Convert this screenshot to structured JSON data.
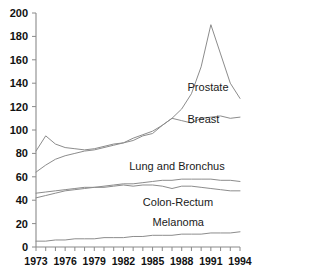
{
  "chart_data": {
    "type": "line",
    "title": "",
    "subtitle": "",
    "xlabel": "",
    "ylabel": "",
    "xlim": [
      1973,
      1994
    ],
    "ylim": [
      0,
      200
    ],
    "grid": false,
    "legend_position": "inline-right",
    "y_ticks": [
      0,
      20,
      40,
      60,
      80,
      100,
      120,
      140,
      160,
      180,
      200
    ],
    "y_tick_labels": [
      "0",
      "20",
      "40",
      "60",
      "80",
      "100",
      "120",
      "140",
      "160",
      "180",
      "200"
    ],
    "x_ticks": [
      1973,
      1974,
      1975,
      1976,
      1977,
      1978,
      1979,
      1980,
      1981,
      1982,
      1983,
      1984,
      1985,
      1986,
      1987,
      1988,
      1989,
      1990,
      1991,
      1992,
      1993,
      1994
    ],
    "x_tick_labels": [
      "1973",
      "1976",
      "1979",
      "1982",
      "1985",
      "1988",
      "1991",
      "1994"
    ],
    "x_labeled_ticks": [
      1973,
      1976,
      1979,
      1982,
      1985,
      1988,
      1991,
      1994
    ],
    "x": [
      1973,
      1974,
      1975,
      1976,
      1977,
      1978,
      1979,
      1980,
      1981,
      1982,
      1983,
      1984,
      1985,
      1986,
      1987,
      1988,
      1989,
      1990,
      1991,
      1992,
      1993,
      1994
    ],
    "series": [
      {
        "name": "Prostate",
        "label": "Prostate",
        "color": "#8c8c8c",
        "label_x": 1988.6,
        "label_y": 133,
        "values": [
          82,
          95,
          88,
          85,
          84,
          83,
          84,
          86,
          88,
          89,
          93,
          96,
          99,
          104,
          110,
          118,
          131,
          154,
          190,
          165,
          140,
          127
        ]
      },
      {
        "name": "Breast",
        "label": "Breast",
        "color": "#8c8c8c",
        "label_x": 1988.6,
        "label_y": 106,
        "values": [
          64,
          70,
          75,
          78,
          80,
          82,
          83,
          85,
          87,
          89,
          91,
          95,
          97,
          104,
          110,
          108,
          106,
          110,
          111,
          112,
          110,
          111
        ]
      },
      {
        "name": "Lung and Bronchus",
        "label": "Lung and Bronchus",
        "color": "#8c8c8c",
        "label_x": 1982.6,
        "label_y": 66,
        "values": [
          46,
          47,
          48,
          49,
          50,
          51,
          51,
          52,
          53,
          54,
          54,
          55,
          56,
          57,
          57,
          58,
          58,
          58,
          58,
          57,
          57,
          56
        ]
      },
      {
        "name": "Colon-Rectum",
        "label": "Colon-Rectum",
        "color": "#8c8c8c",
        "label_x": 1984.0,
        "label_y": 35,
        "values": [
          42,
          44,
          46,
          48,
          49,
          50,
          51,
          51,
          52,
          53,
          52,
          53,
          53,
          52,
          50,
          52,
          52,
          51,
          50,
          49,
          48,
          48
        ]
      },
      {
        "name": "Melanoma",
        "label": "Melanoma",
        "color": "#8c8c8c",
        "label_x": 1985.0,
        "label_y": 18,
        "values": [
          5,
          5,
          6,
          6,
          7,
          7,
          7,
          8,
          8,
          8,
          9,
          9,
          10,
          10,
          10,
          11,
          11,
          11,
          12,
          12,
          12,
          13
        ]
      }
    ]
  }
}
